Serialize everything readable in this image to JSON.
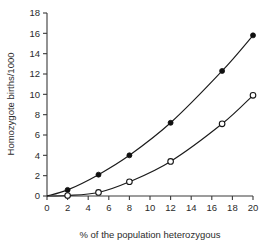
{
  "chart_data": {
    "type": "line",
    "title": "",
    "subtitle": "",
    "xlabel": "% of the population heterozygous",
    "ylabel": "Homozygote births/1000",
    "xlim": [
      0,
      20
    ],
    "ylim": [
      0,
      18
    ],
    "xticks": [
      0,
      2,
      4,
      6,
      8,
      10,
      12,
      14,
      16,
      18,
      20
    ],
    "yticks": [
      0,
      2,
      4,
      6,
      8,
      10,
      12,
      14,
      16,
      18
    ],
    "xtick_labels": [
      "0",
      "2",
      "4",
      "6",
      "8",
      "10",
      "12",
      "14",
      "16",
      "18",
      "20"
    ],
    "ytick_labels": [
      "0",
      "2",
      "4",
      "6",
      "8",
      "10",
      "12",
      "14",
      "16",
      "18"
    ],
    "grid": false,
    "legend": null,
    "legend_position": "none",
    "annotations": [],
    "series": [
      {
        "name": "filled-circles",
        "marker": "filled-circle",
        "marker_color": "#101010",
        "line_color": "#1b1b1b",
        "x": [
          0,
          2,
          5,
          8,
          12,
          17,
          20
        ],
        "values": [
          0,
          0.6,
          2.1,
          4.0,
          7.2,
          12.3,
          15.8
        ]
      },
      {
        "name": "open-circles",
        "marker": "open-circle",
        "marker_color": "#ffffff",
        "line_color": "#1b1b1b",
        "x": [
          0,
          2,
          5,
          8,
          12,
          17,
          20
        ],
        "values": [
          0,
          0.05,
          0.35,
          1.4,
          3.4,
          7.1,
          9.9
        ]
      }
    ]
  },
  "figure": {
    "background": "#ffffff",
    "axis_color": "#3a3a3a",
    "text_color": "#2b2b2b"
  }
}
